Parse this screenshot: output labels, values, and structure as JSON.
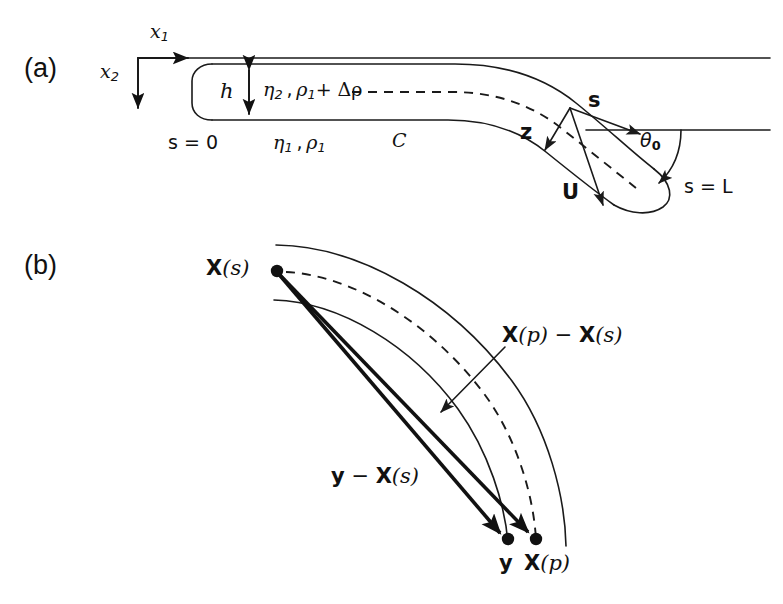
{
  "figure": {
    "background_color": "#ffffff",
    "ink_color": "#111111",
    "width": 783,
    "height": 604
  },
  "panels": [
    {
      "id": "a",
      "tag": "(a)",
      "description": "Bent slender filament of thickness h in ambient fluid, with coordinate axes, unit vectors and tip angle"
    },
    {
      "id": "b",
      "tag": "(b)",
      "description": "Curved filament centreline with position vectors from X(s) to y and X(p)"
    }
  ],
  "panel_a": {
    "tag": "(a)",
    "axes": {
      "x1_label": "x",
      "x1_sub": "1",
      "x2_label": "x",
      "x2_sub": "2",
      "origin_note": "axes origin at top-left of domain"
    },
    "labels": {
      "thickness": "h",
      "inner_fluid": "η₂ , ρ₁ + Δρ",
      "inner_fluid_parts": {
        "eta": "η",
        "eta_sub": "2",
        "rho": "ρ",
        "rho_sub": "1",
        "delta_rho": "+ Δρ"
      },
      "outer_fluid": "η₁ , ρ₁",
      "outer_fluid_parts": {
        "eta": "η",
        "eta_sub": "1",
        "rho": "ρ",
        "rho_sub": "1"
      },
      "curve_name": "C",
      "arclength_start": "s = 0",
      "arclength_end": "s = L",
      "tangent_vector": "s",
      "normal_vector": "z",
      "velocity_vector": "U",
      "tip_angle": "θ",
      "tip_angle_sub": "0"
    }
  },
  "panel_b": {
    "tag": "(b)",
    "labels": {
      "source_point": "X(s)",
      "source_point_parts": {
        "bold": "X",
        "arg": "(s)"
      },
      "field_point": "y",
      "target_point": "X(p)",
      "target_point_parts": {
        "bold": "X",
        "arg": "(p)"
      },
      "separation_material": "X(p) − X(s)",
      "separation_material_parts": {
        "bold1": "X",
        "arg1": "(p)",
        "minus": " − ",
        "bold2": "X",
        "arg2": "(s)"
      },
      "separation_field": "y − X(s)",
      "separation_field_parts": {
        "bold1": "y",
        "minus": " − ",
        "bold2": "X",
        "arg2": "(s)"
      }
    }
  },
  "geometry_notes": {
    "panel_a_tube": "slender tube of uniform thickness h running horizontally then bending downward, rounded caps at s=0 (left) and s=L (right tip)",
    "panel_a_dashed": "dashed centreline of the tube",
    "panel_a_reference_line": "horizontal dashed/solid reference line through the tip used to measure theta_0",
    "panel_b_band": "curved band: outer solid arc, inner solid arc, dashed centre arc",
    "panel_b_arrows": "two thick arrows from X(s) down-right to y and to X(p); thin leader arrow from the X(p)-X(s) label"
  }
}
